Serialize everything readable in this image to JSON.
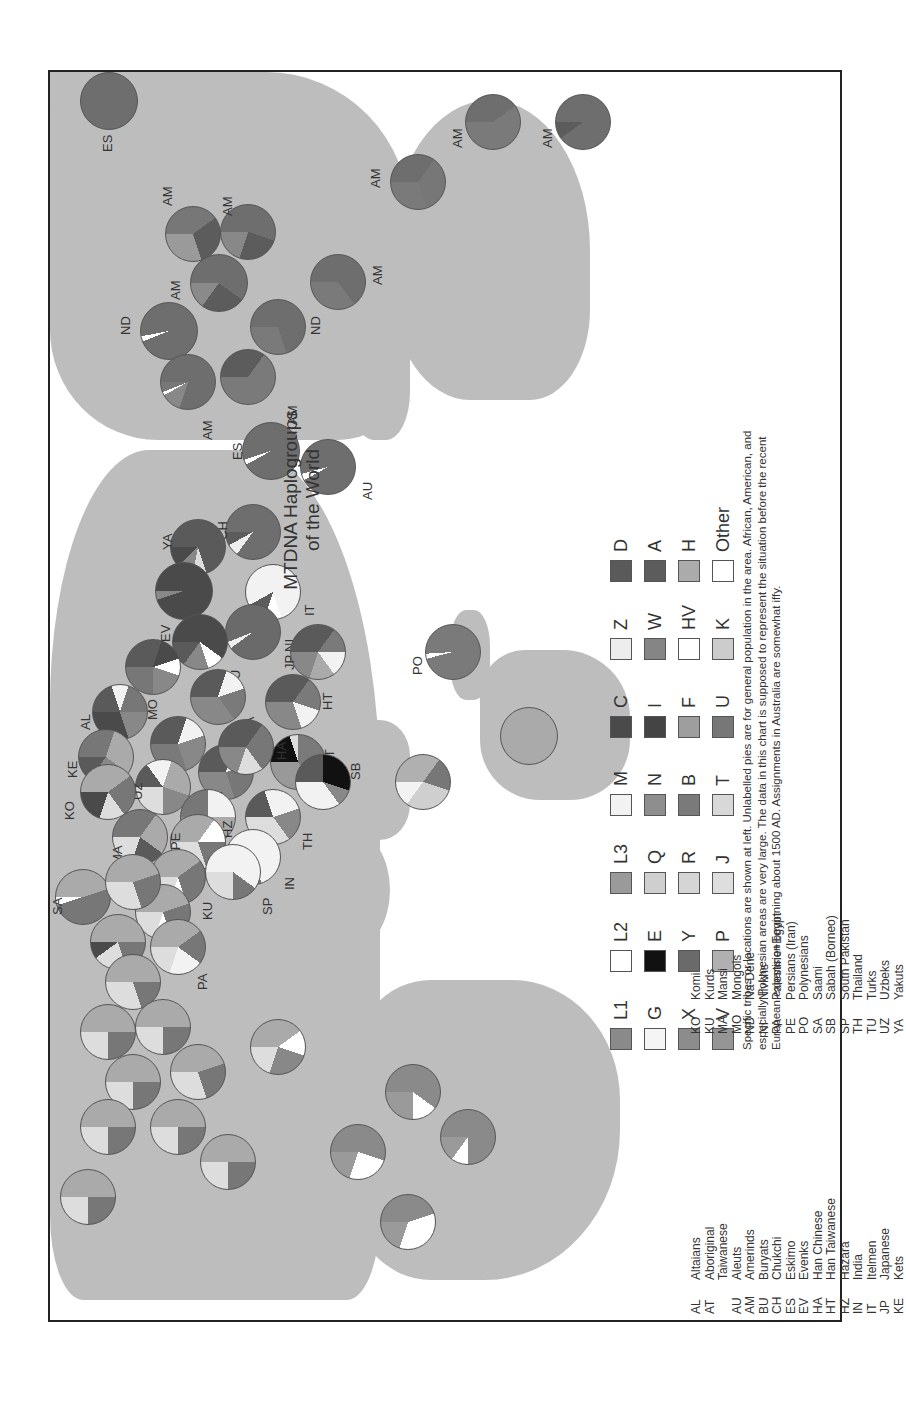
{
  "title": {
    "line1": "MTDNA Haplogroups",
    "line2": "of the World"
  },
  "haplogroup_legend": [
    {
      "code": "L1",
      "color": "#8a8a8a"
    },
    {
      "code": "L2",
      "color": "#ffffff"
    },
    {
      "code": "L3",
      "color": "#9a9a9a"
    },
    {
      "code": "M",
      "color": "#f2f2f2"
    },
    {
      "code": "C",
      "color": "#4a4a4a"
    },
    {
      "code": "Z",
      "color": "#ededed"
    },
    {
      "code": "D",
      "color": "#5a5a5a"
    },
    {
      "code": "G",
      "color": "#f5f5f5"
    },
    {
      "code": "E",
      "color": "#111111"
    },
    {
      "code": "Q",
      "color": "#cfcfcf"
    },
    {
      "code": "N",
      "color": "#8e8e8e"
    },
    {
      "code": "I",
      "color": "#444444"
    },
    {
      "code": "W",
      "color": "#858585"
    },
    {
      "code": "A",
      "color": "#5c5c5c"
    },
    {
      "code": "X",
      "color": "#8c8c8c"
    },
    {
      "code": "Y",
      "color": "#6a6a6a"
    },
    {
      "code": "R",
      "color": "#d5d5d5"
    },
    {
      "code": "B",
      "color": "#7a7a7a"
    },
    {
      "code": "F",
      "color": "#9e9e9e"
    },
    {
      "code": "HV",
      "color": "#ffffff"
    },
    {
      "code": "H",
      "color": "#ababab"
    },
    {
      "code": "V",
      "color": "#959595"
    },
    {
      "code": "P",
      "color": "#b0b0b0"
    },
    {
      "code": "J",
      "color": "#dedede"
    },
    {
      "code": "T",
      "color": "#d8d8d8"
    },
    {
      "code": "U",
      "color": "#777777"
    },
    {
      "code": "K",
      "color": "#cccccc"
    },
    {
      "code": "Other",
      "color": "#ffffff"
    }
  ],
  "note": "Specific tribes or locations are shown at left. Unlabelled pies are for general population in the area. African, American, and especially Polynesian areas are very large. The data in this chart is supposed to represent the situation before the recent European expansion beginning about 1500 AD. Assignments in Australia are somewhat iffy.",
  "abbreviations": {
    "col1": [
      {
        "code": "AL",
        "name": "Altaians"
      },
      {
        "code": "AT",
        "name": "Aboriginal"
      },
      {
        "code": "",
        "name": "Taiwanese"
      },
      {
        "code": "AU",
        "name": "Aleuts"
      },
      {
        "code": "AM",
        "name": "Amerinds"
      },
      {
        "code": "BU",
        "name": "Buryats"
      },
      {
        "code": "CH",
        "name": "Chukchi"
      },
      {
        "code": "ES",
        "name": "Eskimo"
      },
      {
        "code": "EV",
        "name": "Evenks"
      },
      {
        "code": "HA",
        "name": "Han Chinese"
      },
      {
        "code": "HT",
        "name": "Han Taiwanese"
      },
      {
        "code": "HZ",
        "name": "Hazara"
      },
      {
        "code": "IN",
        "name": "India"
      },
      {
        "code": "IT",
        "name": "Itelmen"
      },
      {
        "code": "JP",
        "name": "Japanese"
      },
      {
        "code": "KE",
        "name": "Kets"
      }
    ],
    "col2": [
      {
        "code": "KO",
        "name": "Komi"
      },
      {
        "code": "KU",
        "name": "Kurds"
      },
      {
        "code": "MA",
        "name": "Mansi"
      },
      {
        "code": "MO",
        "name": "Mongols"
      },
      {
        "code": "ND",
        "name": "Na-Dene"
      },
      {
        "code": "NI",
        "name": "Nivkhs"
      },
      {
        "code": "PA",
        "name": "Palestine+Egypt"
      },
      {
        "code": "PE",
        "name": "Persians (Iran)"
      },
      {
        "code": "PO",
        "name": "Polynesians"
      },
      {
        "code": "SA",
        "name": "Saami"
      },
      {
        "code": "SB",
        "name": "Sabah (Borneo)"
      },
      {
        "code": "SP",
        "name": "South Pakistan"
      },
      {
        "code": "TH",
        "name": "Thailand"
      },
      {
        "code": "TU",
        "name": "Turks"
      },
      {
        "code": "UZ",
        "name": "Uzbeks"
      },
      {
        "code": "YA",
        "name": "Yakuts"
      }
    ]
  },
  "chart_data": {
    "type": "pie",
    "title": "MTDNA Haplogroups of the World",
    "note": "Map of pie charts showing mitochondrial DNA haplogroup frequencies per population; image rotated 90° counter-clockwise.",
    "pies": [
      {
        "label": "ES",
        "region": "Greenland",
        "dominant": "A"
      },
      {
        "label": "AM",
        "region": "North America NE",
        "dominant": "A/B/C"
      },
      {
        "label": "AM",
        "region": "North America E",
        "dominant": "A/B/C"
      },
      {
        "label": "AM",
        "region": "North America central",
        "dominant": "A/B/C"
      },
      {
        "label": "ND",
        "region": "North America NW",
        "dominant": "A"
      },
      {
        "label": "AM",
        "region": "North America W",
        "dominant": "A/B"
      },
      {
        "label": "AM",
        "region": "North America S",
        "dominant": "A/B"
      },
      {
        "label": "ND",
        "region": "North America SW",
        "dominant": "A/B"
      },
      {
        "label": "AM",
        "region": "Central America",
        "dominant": "A/B"
      },
      {
        "label": "AM",
        "region": "South America N",
        "dominant": "B/C/D"
      },
      {
        "label": "AM",
        "region": "South America central",
        "dominant": "B/C/D"
      },
      {
        "label": "AM",
        "region": "South America S",
        "dominant": "C/D"
      },
      {
        "label": "ES",
        "region": "Alaska/Siberia",
        "dominant": "A/D"
      },
      {
        "label": "AU",
        "region": "Aleutians",
        "dominant": "D"
      },
      {
        "label": "CH",
        "region": "Chukotka",
        "dominant": "A/D"
      },
      {
        "label": "IT",
        "region": "Kamchatka",
        "dominant": "G"
      },
      {
        "label": "YA",
        "region": "Yakutia",
        "dominant": "C/D"
      },
      {
        "label": "NI",
        "region": "Amur",
        "dominant": "Y"
      },
      {
        "label": "EV",
        "region": "Central Siberia",
        "dominant": "C"
      },
      {
        "label": "BU",
        "region": "Baikal",
        "dominant": "C/D"
      },
      {
        "label": "JP",
        "region": "Japan",
        "dominant": "D/B/M"
      },
      {
        "label": "MO",
        "region": "Mongolia",
        "dominant": "D/C"
      },
      {
        "label": "HA",
        "region": "North China",
        "dominant": "D"
      },
      {
        "label": "HT",
        "region": "Taiwan",
        "dominant": "B/F/D"
      },
      {
        "label": "AT",
        "region": "Taiwan aboriginal",
        "dominant": "E/B/F"
      },
      {
        "label": "AL",
        "region": "Altai",
        "dominant": "C/D"
      },
      {
        "label": "HA",
        "region": "Central China",
        "dominant": "D"
      },
      {
        "label": "HA",
        "region": "South China",
        "dominant": "B/F"
      },
      {
        "label": "SB",
        "region": "Borneo",
        "dominant": "E/B/M"
      },
      {
        "label": "TH",
        "region": "Thailand",
        "dominant": "M/F/B"
      },
      {
        "label": "KE",
        "region": "Yenisei",
        "dominant": "U/H"
      },
      {
        "label": "UZ",
        "region": "Uzbekistan",
        "dominant": "mixed"
      },
      {
        "label": "HZ",
        "region": "Afghanistan",
        "dominant": "mixed"
      },
      {
        "label": "IN",
        "region": "India",
        "dominant": "M"
      },
      {
        "label": "KO",
        "region": "Urals",
        "dominant": "H/U"
      },
      {
        "label": "MA",
        "region": "West Siberia",
        "dominant": "U/H"
      },
      {
        "label": "PE",
        "region": "Iran",
        "dominant": "H/mixed"
      },
      {
        "label": "SP",
        "region": "South Pakistan",
        "dominant": "M"
      },
      {
        "label": "KU",
        "region": "Kurdistan",
        "dominant": "H/U"
      },
      {
        "label": "TU",
        "region": "Turkey",
        "dominant": "H"
      },
      {
        "label": "PA",
        "region": "Levant/Egypt",
        "dominant": "H/mixed"
      },
      {
        "label": "SA",
        "region": "Scandinavia north",
        "dominant": "U/V"
      },
      {
        "label": "PO",
        "region": "Pacific",
        "dominant": "B"
      },
      {
        "label": "",
        "region": "New Guinea",
        "dominant": "P/Q/M"
      },
      {
        "label": "",
        "region": "Australia",
        "dominant": "M/N"
      },
      {
        "label": "",
        "region": "Europe (several)",
        "dominant": "H"
      },
      {
        "label": "",
        "region": "Africa (several)",
        "dominant": "L1/L2/L3"
      }
    ]
  }
}
